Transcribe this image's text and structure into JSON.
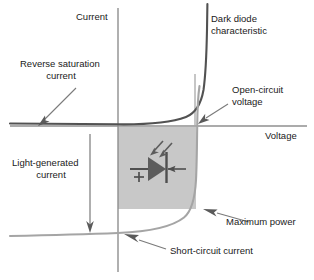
{
  "figure": {
    "type": "annotated-iv-curve-diagram",
    "axes": {
      "y_label": "Current",
      "x_label": "Voltage",
      "x_axis_y_px": 126,
      "y_axis_x_px": 118
    },
    "labels": {
      "current": "Current",
      "voltage": "Voltage",
      "dark_diode": "Dark diode\ncharacteristic",
      "dark_diode_line1": "Dark diode",
      "dark_diode_line2": "characteristic",
      "reverse_saturation": "Reverse saturation\ncurrent",
      "reverse_saturation_line1": "Reverse saturation",
      "reverse_saturation_line2": "current",
      "open_circuit": "Open-circuit\nvoltage",
      "open_circuit_line1": "Open-circuit",
      "open_circuit_line2": "voltage",
      "light_generated": "Light-generated\ncurrent",
      "light_generated_line1": "Light-generated",
      "light_generated_line2": "current",
      "maximum_power": "Maximum power",
      "short_circuit": "Short-circuit current",
      "diode_polarity_plus": "+"
    },
    "colors": {
      "background": "#ffffff",
      "dark_curve": "#4a4a4a",
      "light_curve": "#9a9a9a",
      "axis": "#8f8f8f",
      "annotation_line": "#7a7a7a",
      "power_rect_fill": "#c8c8c8",
      "symbol": "#5a5a5a",
      "text": "#1a1a1a"
    },
    "regions": {
      "maximum_power_rectangle": {
        "x": 118,
        "y": 127,
        "width": 78,
        "height": 82,
        "fill": "#c8c8c8"
      }
    },
    "symbols": {
      "photodiode": "photodiode-symbol",
      "light_arrows": 2,
      "current_arrow_direction": "left"
    }
  }
}
